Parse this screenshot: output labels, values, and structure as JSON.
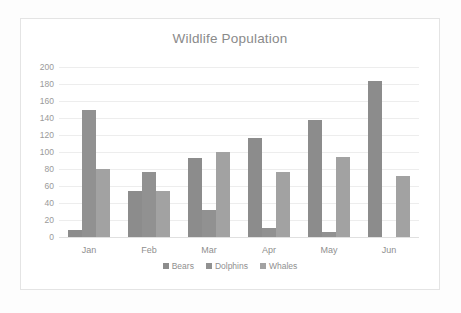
{
  "chart_data": {
    "type": "bar",
    "title": "Wildlife Population",
    "xlabel": "",
    "ylabel": "",
    "categories": [
      "Jan",
      "Feb",
      "Mar",
      "Apr",
      "May",
      "Jun"
    ],
    "series": [
      {
        "name": "Bears",
        "values": [
          8,
          54,
          93,
          117,
          138,
          184
        ],
        "color": "#8c8c8c"
      },
      {
        "name": "Dolphins",
        "values": [
          149,
          77,
          32,
          11,
          6,
          0
        ],
        "color": "#919191"
      },
      {
        "name": "Whales",
        "values": [
          80,
          54,
          100,
          76,
          94,
          72
        ],
        "color": "#a2a2a2"
      }
    ],
    "ylim": [
      0,
      200
    ],
    "ytick_step": 20,
    "yticks": [
      "200",
      "180",
      "160",
      "140",
      "120",
      "100",
      "80",
      "60",
      "40",
      "20",
      "0"
    ],
    "grid": true,
    "legend_position": "bottom"
  },
  "colors": {
    "background": "#ffffff",
    "frame_border": "#e4e4e4",
    "gridline": "#ededed",
    "title_text": "#8a8a8a",
    "tick_text": "#9a9a9a",
    "legend_text": "#8f8f8f"
  }
}
